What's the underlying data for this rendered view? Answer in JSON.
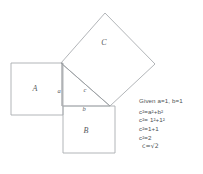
{
  "diagram": {
    "squares": [
      {
        "id": "A",
        "label": "A",
        "label_x": 35,
        "label_y": 91
      },
      {
        "id": "B",
        "label": "B",
        "label_x": 86,
        "label_y": 133
      },
      {
        "id": "C",
        "label": "C",
        "label_x": 104,
        "label_y": 45
      }
    ],
    "side_labels": [
      {
        "id": "a",
        "label": "a",
        "label_x": 59,
        "label_y": 93
      },
      {
        "id": "b",
        "label": "b",
        "label_x": 84,
        "label_y": 111
      },
      {
        "id": "c",
        "label": "c",
        "label_x": 85,
        "label_y": 92
      }
    ],
    "geometry": {
      "square_a": "11,63 63,63 63,115 11,115",
      "square_b": "63,106 115,106 115,153 63,153",
      "square_c": "61,63 105,13 155,64 110,106",
      "triangle": "61,63 63,106 110,106",
      "leg_a": "62,63 62,106",
      "leg_b": "63,106 110,106",
      "hypotenuse": "61,63 110,106"
    },
    "colors": {
      "stroke": "#a9adb0",
      "stroke_emphasis": "#8e9295",
      "label": "#55595c",
      "background": "#ffffff"
    }
  },
  "math": {
    "given": "Given a=1, b=1",
    "lines": [
      {
        "lhs": "c",
        "lhs_sup": "2",
        "eq": "=",
        "rhs_pre": "a",
        "rhs_sup1": "2",
        "op": "+",
        "rhs_post": "b",
        "rhs_sup2": "2"
      }
    ],
    "steps": [
      {
        "text": "c²=a²+b²"
      },
      {
        "text": "c²= 1²+1²"
      },
      {
        "text": "c²=1+1"
      },
      {
        "text": "c²=2"
      },
      {
        "text": "c=√2"
      }
    ],
    "step_1_base": "c",
    "step_1_exp": "2",
    "step_1_rest_a": "a",
    "step_1_rest_b": "b",
    "step_2_nums": "1",
    "step_3_rhs": "1+1",
    "step_4_rhs": "2",
    "step_5_lhs": "c",
    "step_5_rhs": "2",
    "radical_glyph": "√",
    "equals": "=",
    "plus": "+"
  }
}
